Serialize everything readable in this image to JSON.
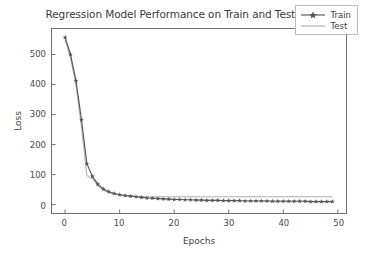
{
  "chart_data": {
    "type": "line",
    "title": "Regression Model Performance on Train and Test sets",
    "xlabel": "Epochs",
    "ylabel": "Loss",
    "xlim": [
      -2.4,
      51.5
    ],
    "ylim": [
      -28,
      585
    ],
    "xticks": [
      0,
      10,
      20,
      30,
      40,
      50
    ],
    "yticks": [
      0,
      100,
      200,
      300,
      400,
      500
    ],
    "grid": false,
    "legend_position": "upper right",
    "x": [
      0,
      1,
      2,
      3,
      4,
      5,
      6,
      7,
      8,
      9,
      10,
      11,
      12,
      13,
      14,
      15,
      16,
      17,
      18,
      19,
      20,
      21,
      22,
      23,
      24,
      25,
      26,
      27,
      28,
      29,
      30,
      31,
      32,
      33,
      34,
      35,
      36,
      37,
      38,
      39,
      40,
      41,
      42,
      43,
      44,
      45,
      46,
      47,
      48,
      49
    ],
    "series": [
      {
        "name": "Train",
        "color": "#555555",
        "marker": "star",
        "values": [
          557,
          500,
          412,
          283,
          136,
          94,
          68,
          52,
          43,
          37,
          33,
          30,
          28,
          26,
          24,
          22,
          21,
          20,
          19,
          18,
          17,
          17,
          16,
          16,
          15,
          15,
          14,
          14,
          14,
          13,
          13,
          13,
          13,
          12,
          12,
          12,
          12,
          12,
          11,
          11,
          11,
          11,
          11,
          11,
          11,
          10,
          10,
          10,
          10,
          10
        ]
      },
      {
        "name": "Test",
        "color": "#a8a8a8",
        "marker": "none",
        "values": [
          548,
          489,
          398,
          258,
          96,
          86,
          62,
          48,
          40,
          35,
          32,
          30,
          29,
          28,
          27,
          26,
          26,
          26,
          26,
          26,
          26,
          26,
          26,
          26,
          26,
          26,
          26,
          26,
          26,
          26,
          26,
          26,
          26,
          26,
          26,
          26,
          26,
          26,
          26,
          26,
          26,
          26,
          26,
          26,
          26,
          26,
          26,
          26,
          26,
          26
        ]
      }
    ]
  },
  "legend": {
    "items": [
      {
        "label": "Train"
      },
      {
        "label": "Test"
      }
    ]
  },
  "colors": {
    "train": "#555555",
    "test": "#a8a8a8",
    "axis": "#6f6f6f",
    "text": "#3c3c3c",
    "background": "#ffffff"
  }
}
